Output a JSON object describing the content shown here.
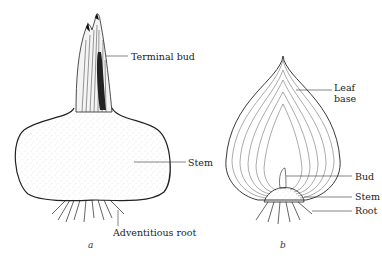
{
  "figure_a": {
    "caption": "a",
    "labels": {
      "terminal_bud": "Terminal bud",
      "stem": "Stem",
      "adventitious_root": "Adventitious root"
    }
  },
  "figure_b": {
    "caption": "b",
    "labels": {
      "leaf_base_1": "Leaf",
      "leaf_base_2": "base",
      "bud": "Bud",
      "stem": "Stem",
      "root": "Root"
    }
  }
}
